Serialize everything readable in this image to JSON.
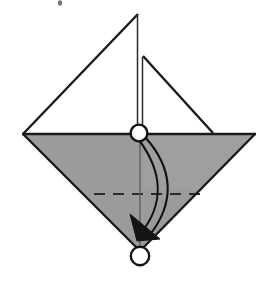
{
  "figure": {
    "description": "Inverted gray triangle (kite base) with an upper white flap triangle, a horizontal valley-fold dashed crease, a vertical center line, two circular reference point markers, and a curved fold arrow pointing from the center marker down to the lower marker.",
    "background_color": "#ffffff",
    "ink_color": "#1a1a1a",
    "paper_gray": "#9b9b9b",
    "paper_gray_light": "#a8a8a8"
  },
  "shapes": {
    "gray_triangle": {
      "name": "main-gray-triangle",
      "fill": "#9b9b9b",
      "points": "23,134 255,134 140,250"
    },
    "white_flap_left": {
      "name": "white-flap-left-triangle",
      "points": "23,134 138,134 138,14"
    },
    "white_flap_right": {
      "name": "white-flap-right-triangle",
      "points": "143,57 143,133 213,133"
    }
  },
  "lines": {
    "diamond_left_edge": {
      "name": "diamond-left-edge",
      "from": "23,134",
      "to": "140,250"
    },
    "diamond_right_edge": {
      "name": "diamond-right-edge",
      "from": "255,134",
      "to": "140,250"
    },
    "horizontal_spine": {
      "name": "horizontal-spine",
      "from": "23,134",
      "to": "255,134"
    },
    "apex_to_left": {
      "name": "apex-to-left-vertex",
      "from": "138,14",
      "to": "23,134"
    },
    "apex_vertical": {
      "name": "apex-vertical-line",
      "from": "138,14",
      "to": "138,127"
    },
    "small_apex_vertical": {
      "name": "small-flap-vertical-line",
      "from": "143,57",
      "to": "143,130"
    },
    "small_apex_slope": {
      "name": "small-flap-slope",
      "from": "143,57",
      "to": "213,133"
    },
    "center_vertical": {
      "name": "center-vertical-fold-line",
      "from": "140,141",
      "to": "140,249"
    }
  },
  "crease": {
    "name": "valley-fold-dashed-crease",
    "style": "dashed",
    "y": 194,
    "x_start": 94,
    "x_end": 200,
    "dash_pattern": "11 8"
  },
  "markers": [
    {
      "name": "reference-point-center",
      "cx": 139,
      "cy": 133,
      "r": 8.4,
      "label": "center point"
    },
    {
      "name": "reference-point-bottom",
      "cx": 140,
      "cy": 256,
      "r": 9.2,
      "label": "bottom point"
    }
  ],
  "fold_arrow": {
    "name": "fold-arrow-curved",
    "direction": "down",
    "outer_path": "M 145,137 C 171,167 175,200 150,235",
    "inner_path": "M 140,139 C 163,170 166,202 142,232",
    "arrowhead_points": "131,216 159,238 136,240",
    "description": "curved double-line arrow from center marker to bottom marker"
  },
  "speck": {
    "name": "ink-speck",
    "cx": 60,
    "cy": 3,
    "rx": 2.2,
    "ry": 2.6
  }
}
